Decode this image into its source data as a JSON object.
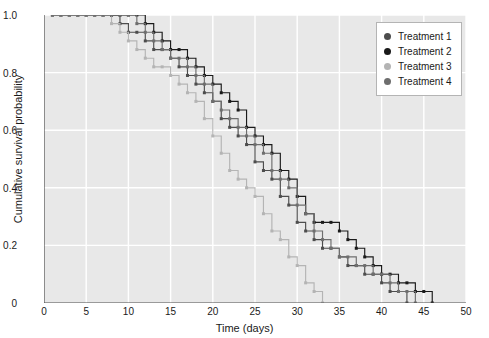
{
  "chart_data": {
    "type": "line",
    "title": "",
    "xlabel": "Time (days)",
    "ylabel": "Cumulative survival probability",
    "xlim": [
      0,
      50
    ],
    "ylim": [
      0,
      1.0
    ],
    "xticks": [
      0,
      5,
      10,
      15,
      20,
      25,
      30,
      35,
      40,
      45,
      50
    ],
    "yticks": [
      "0",
      "0.2",
      "0.4",
      "0.6",
      "0.8",
      "1.0"
    ],
    "ytick_values": [
      0,
      0.2,
      0.4,
      0.6,
      0.8,
      1.0
    ],
    "grid": true,
    "grid_color": "#ffffff",
    "plot_background": "#e8e8e8",
    "legend_position": "top-right",
    "step_style": "post",
    "marker": "square",
    "series": [
      {
        "name": "Treatment 1",
        "color": "#4d4d4d",
        "x": [
          1,
          2,
          3,
          4,
          5,
          6,
          7,
          8,
          9,
          10,
          11,
          12,
          13,
          14,
          15,
          16,
          17,
          18,
          19,
          20,
          21,
          22,
          23,
          24,
          25,
          26,
          27,
          28,
          29,
          30,
          31,
          32,
          33,
          34,
          35,
          36,
          37,
          38,
          39,
          40,
          41,
          42,
          43
        ],
        "y": [
          1.0,
          1.0,
          1.0,
          1.0,
          1.0,
          1.0,
          1.0,
          1.0,
          0.97,
          0.94,
          0.94,
          0.91,
          0.88,
          0.88,
          0.85,
          0.82,
          0.79,
          0.76,
          0.73,
          0.7,
          0.64,
          0.61,
          0.58,
          0.55,
          0.49,
          0.46,
          0.43,
          0.37,
          0.34,
          0.28,
          0.25,
          0.22,
          0.19,
          0.19,
          0.16,
          0.13,
          0.13,
          0.1,
          0.1,
          0.07,
          0.04,
          0.04,
          0.0
        ]
      },
      {
        "name": "Treatment 2",
        "color": "#1a1a1a",
        "x": [
          1,
          2,
          3,
          4,
          5,
          6,
          7,
          8,
          9,
          10,
          11,
          12,
          13,
          14,
          15,
          16,
          17,
          18,
          19,
          20,
          21,
          22,
          23,
          24,
          25,
          26,
          27,
          28,
          29,
          30,
          31,
          32,
          33,
          34,
          35,
          36,
          37,
          38,
          39,
          40,
          41,
          42,
          43,
          44,
          45,
          46
        ],
        "y": [
          1.0,
          1.0,
          1.0,
          1.0,
          1.0,
          1.0,
          1.0,
          1.0,
          1.0,
          1.0,
          1.0,
          0.97,
          0.94,
          0.91,
          0.88,
          0.88,
          0.85,
          0.82,
          0.79,
          0.76,
          0.73,
          0.7,
          0.67,
          0.61,
          0.58,
          0.55,
          0.52,
          0.46,
          0.43,
          0.37,
          0.31,
          0.28,
          0.28,
          0.28,
          0.25,
          0.22,
          0.19,
          0.16,
          0.13,
          0.1,
          0.1,
          0.07,
          0.07,
          0.04,
          0.04,
          0.0
        ]
      },
      {
        "name": "Treatment 3",
        "color": "#b4b4b4",
        "x": [
          1,
          2,
          3,
          4,
          5,
          6,
          7,
          8,
          9,
          10,
          11,
          12,
          13,
          14,
          15,
          16,
          17,
          18,
          19,
          20,
          21,
          22,
          23,
          24,
          25,
          26,
          27,
          28,
          29,
          30,
          31,
          32,
          33
        ],
        "y": [
          1.0,
          1.0,
          1.0,
          1.0,
          1.0,
          1.0,
          1.0,
          0.97,
          0.94,
          0.91,
          0.88,
          0.85,
          0.82,
          0.82,
          0.79,
          0.76,
          0.73,
          0.7,
          0.64,
          0.58,
          0.52,
          0.46,
          0.43,
          0.4,
          0.37,
          0.31,
          0.25,
          0.22,
          0.16,
          0.13,
          0.07,
          0.04,
          0.0
        ]
      },
      {
        "name": "Treatment 4",
        "color": "#6e6e6e",
        "x": [
          1,
          2,
          3,
          4,
          5,
          6,
          7,
          8,
          9,
          10,
          11,
          12,
          13,
          14,
          15,
          16,
          17,
          18,
          19,
          20,
          21,
          22,
          23,
          24,
          25,
          26,
          27,
          28,
          29,
          30,
          31,
          32,
          33,
          34,
          35,
          36,
          37,
          38,
          39,
          40,
          41,
          42,
          43,
          44
        ],
        "y": [
          1.0,
          1.0,
          1.0,
          1.0,
          1.0,
          1.0,
          1.0,
          1.0,
          1.0,
          1.0,
          0.97,
          0.94,
          0.91,
          0.88,
          0.85,
          0.85,
          0.82,
          0.79,
          0.76,
          0.7,
          0.67,
          0.64,
          0.61,
          0.58,
          0.55,
          0.52,
          0.46,
          0.43,
          0.4,
          0.34,
          0.31,
          0.25,
          0.22,
          0.19,
          0.16,
          0.16,
          0.13,
          0.13,
          0.1,
          0.1,
          0.07,
          0.04,
          0.04,
          0.0
        ]
      }
    ]
  },
  "legend": {
    "entries": [
      {
        "label": "Treatment 1",
        "color": "#4d4d4d"
      },
      {
        "label": "Treatment 2",
        "color": "#1a1a1a"
      },
      {
        "label": "Treatment 3",
        "color": "#b4b4b4"
      },
      {
        "label": "Treatment 4",
        "color": "#6e6e6e"
      }
    ]
  }
}
